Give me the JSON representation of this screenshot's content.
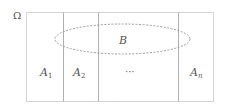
{
  "diagram": {
    "universe_label": "Ω",
    "event_label": "B",
    "partitions": [
      {
        "name": "A",
        "sub": "1"
      },
      {
        "name": "A",
        "sub": "2"
      },
      {
        "name": "···",
        "sub": ""
      },
      {
        "name": "A",
        "sub": "n"
      }
    ],
    "colors": {
      "border": "#a8a8a8",
      "divider": "#b0b0b0",
      "ellipse": "#9a9a9a",
      "text": "#555555"
    }
  }
}
